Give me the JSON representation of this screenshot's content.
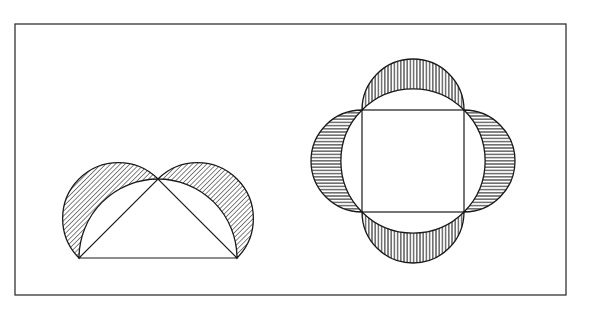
{
  "figure": {
    "frame": {
      "x": 15,
      "y": 24,
      "width": 551,
      "height": 271,
      "stroke": "#333333"
    },
    "line_color": "#1a1a1a",
    "background": "#ffffff"
  },
  "left_figure": {
    "name": "Isosceles right triangle inscribed in semicircle with lunes on the legs",
    "triangle": {
      "A": [
        79,
        258
      ],
      "B": [
        237,
        258
      ],
      "C": [
        158,
        179
      ]
    },
    "big_semicircle": {
      "cx": 158,
      "cy": 258,
      "r": 79
    },
    "lunes": [
      {
        "side": "AC",
        "hatch": "diagonal"
      },
      {
        "side": "CB",
        "hatch": "diagonal"
      }
    ]
  },
  "right_figure": {
    "name": "Square inscribed in circle with lunes on the four sides",
    "square": {
      "x": 362,
      "y": 110,
      "size": 102
    },
    "circle": {
      "cx": 413,
      "cy": 161,
      "r": 72
    },
    "lunes": [
      {
        "side": "top",
        "hatch": "vertical"
      },
      {
        "side": "bottom",
        "hatch": "vertical"
      },
      {
        "side": "left",
        "hatch": "horizontal"
      },
      {
        "side": "right",
        "hatch": "horizontal"
      }
    ]
  }
}
